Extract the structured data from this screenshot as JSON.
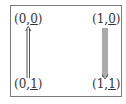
{
  "diagram": {
    "nodes": [
      {
        "id": "n00",
        "first": "0",
        "second": "0"
      },
      {
        "id": "n10",
        "first": "1",
        "second": "0"
      },
      {
        "id": "n01",
        "first": "0",
        "second": "1"
      },
      {
        "id": "n11",
        "first": "1",
        "second": "1"
      }
    ],
    "edges": [
      {
        "from": "(0,1)",
        "to": "(0,0)",
        "style": "double-arrow-up"
      },
      {
        "from": "(1,0)",
        "to": "(1,1)",
        "style": "triple-arrow-down"
      }
    ],
    "colors": {
      "text": "#333333",
      "line": "#444444",
      "frame": "#7a7a7a"
    }
  }
}
